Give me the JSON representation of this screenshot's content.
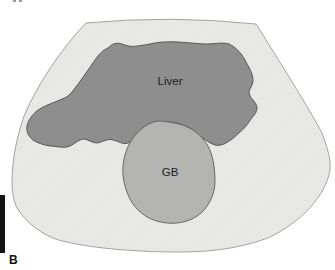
{
  "figure": {
    "panel_label": "B",
    "liver_label": "Liver",
    "gb_label": "GB"
  },
  "colors": {
    "background": "#ffffff",
    "fan_fill": "#e9e9e7",
    "fan_stroke": "#8f8f8f",
    "liver_fill": "#8e8f8e",
    "liver_stroke": "#4f4f4f",
    "gb_fill": "#b5b6b4",
    "gb_stroke": "#5c5c5c",
    "label_color": "#1d1d1d",
    "panel_bar_color": "#141414",
    "panel_label_color": "#111111"
  }
}
